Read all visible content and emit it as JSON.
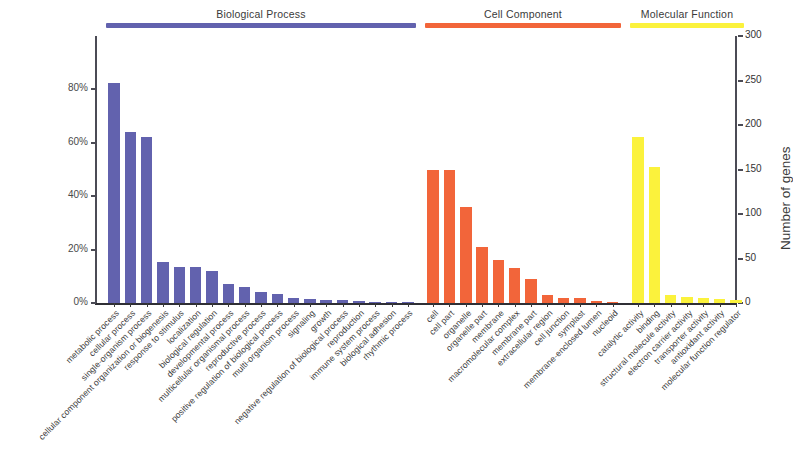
{
  "figure": {
    "y_left_title": "Percent of genes",
    "y_right_title": "Number of genes",
    "y_left_ticks": [
      "0%",
      "20%",
      "40%",
      "60%",
      "80%"
    ],
    "y_right_ticks": [
      "0",
      "50",
      "100",
      "150",
      "200",
      "250",
      "300"
    ],
    "y_left_max_percent": 100,
    "y_right_max_count": 300,
    "colors": {
      "biological_process": "#6262ae",
      "cell_component": "#f2653a",
      "molecular_function": "#fbf23c",
      "axis": "#3a3a3a",
      "text": "#3b3b3b"
    },
    "groups": [
      {
        "id": "bp",
        "label": "Biological Process",
        "color": "#6262ae"
      },
      {
        "id": "cc",
        "label": "Cell Component",
        "color": "#f2653a"
      },
      {
        "id": "mf",
        "label": "Molecular Function",
        "color": "#fbf23c"
      }
    ]
  },
  "chart_data": {
    "type": "bar",
    "title": "",
    "xlabel": "",
    "ylabel": "Percent of genes",
    "ylabel_secondary": "Number of genes",
    "ylim": [
      0,
      100
    ],
    "ylim_secondary": [
      0,
      300
    ],
    "grid": false,
    "legend": "none",
    "group_headers": [
      "Biological Process",
      "Cell Component",
      "Molecular Function"
    ],
    "series": [
      {
        "name": "Biological Process",
        "color": "#6262ae",
        "categories": [
          "metabolic process",
          "cellular process",
          "single-organism process",
          "cellular component organization or biogenesis",
          "response to stimulus",
          "localization",
          "biological regulation",
          "developmental process",
          "multicellular organismal process",
          "reproductive process",
          "positive regulation of biological process",
          "multi-organism process",
          "signaling",
          "growth",
          "negative regulation of biological process",
          "reproduction",
          "immune system process",
          "biological adhesion",
          "rhythmic process"
        ],
        "values": [
          82.5,
          64.0,
          62.0,
          15.5,
          13.5,
          13.5,
          12.0,
          7.0,
          6.0,
          4.0,
          3.2,
          2.0,
          1.5,
          1.2,
          1.0,
          0.8,
          0.5,
          0.4,
          0.2
        ],
        "counts": [
          248,
          192,
          186,
          47,
          41,
          41,
          36,
          21,
          18,
          12,
          10,
          6,
          5,
          4,
          3,
          2,
          2,
          1,
          1
        ]
      },
      {
        "name": "Cell Component",
        "color": "#f2653a",
        "categories": [
          "cell",
          "cell part",
          "organelle",
          "organelle part",
          "membrane",
          "macromolecular complex",
          "membrane part",
          "extracellular region",
          "cell junction",
          "symplast",
          "membrane-enclosed lumen",
          "nucleoid"
        ],
        "values": [
          50.0,
          50.0,
          36.0,
          21.0,
          16.0,
          13.0,
          9.0,
          3.0,
          2.0,
          2.0,
          0.8,
          0.3
        ],
        "counts": [
          150,
          150,
          108,
          63,
          48,
          39,
          27,
          9,
          6,
          6,
          2,
          1
        ]
      },
      {
        "name": "Molecular Function",
        "color": "#fbf23c",
        "categories": [
          "catalytic activity",
          "binding",
          "structural molecule activity",
          "electron carrier activity",
          "transporter activity",
          "antioxidant activity",
          "molecular function regulator"
        ],
        "values": [
          62.0,
          51.0,
          3.0,
          2.2,
          2.0,
          1.6,
          1.2
        ],
        "counts": [
          186,
          153,
          9,
          7,
          6,
          5,
          4
        ]
      }
    ]
  }
}
